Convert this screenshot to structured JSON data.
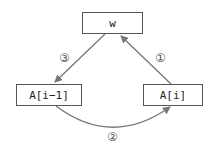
{
  "nodes": {
    "w": {
      "label": "w"
    },
    "a_prev": {
      "label": "A[i−1]"
    },
    "a_cur": {
      "label": "A[i]"
    }
  },
  "edges": [
    {
      "from": "a_cur",
      "to": "w",
      "step": "①"
    },
    {
      "from": "a_prev",
      "to": "a_cur",
      "step": "②"
    },
    {
      "from": "w",
      "to": "a_prev",
      "step": "③"
    }
  ],
  "colors": {
    "arrow": "#777777",
    "box_border": "#555555"
  }
}
